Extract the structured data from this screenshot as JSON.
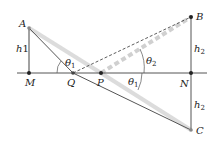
{
  "diagram": {
    "type": "geometry-reflection",
    "points": {
      "A": {
        "label": "A",
        "x": 29,
        "y": 28
      },
      "M": {
        "label": "M",
        "x": 29,
        "y": 73
      },
      "Q": {
        "label": "Q",
        "x": 73,
        "y": 73
      },
      "P": {
        "label": "P",
        "x": 101,
        "y": 73
      },
      "B": {
        "label": "B",
        "x": 191,
        "y": 17
      },
      "N": {
        "label": "N",
        "x": 191,
        "y": 73
      },
      "C": {
        "label": "C",
        "x": 191,
        "y": 130
      }
    },
    "labels": {
      "h1": {
        "main": "h",
        "sub": "1"
      },
      "h2_top": {
        "main": "h",
        "sub": "2"
      },
      "h2_bottom": {
        "main": "h",
        "sub": "2"
      },
      "theta1_left": {
        "main": "θ",
        "sub": "1"
      },
      "theta1_right": {
        "main": "θ",
        "sub": "1"
      },
      "theta2": {
        "main": "θ",
        "sub": "2"
      }
    },
    "colors": {
      "line": "#555555",
      "highlight": "#d8d8d8",
      "point": "#222222",
      "text": "#222222"
    }
  }
}
